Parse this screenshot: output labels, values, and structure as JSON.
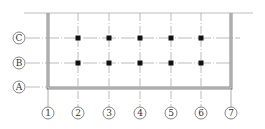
{
  "diagram": {
    "type": "structural-axis-grid",
    "colors": {
      "line": "#b0b0b0",
      "wall": "#8a8a8a",
      "column": "#111111",
      "label": "#444444"
    },
    "rows": [
      {
        "label": "C",
        "y": 38
      },
      {
        "label": "B",
        "y": 63
      },
      {
        "label": "A",
        "y": 87
      }
    ],
    "columns": [
      {
        "label": "1",
        "x": 48
      },
      {
        "label": "2",
        "x": 78
      },
      {
        "label": "3",
        "x": 109
      },
      {
        "label": "4",
        "x": 140
      },
      {
        "label": "5",
        "x": 171
      },
      {
        "label": "6",
        "x": 201
      },
      {
        "label": "7",
        "x": 231
      }
    ],
    "column_markers": [
      {
        "row": "C",
        "col": "2"
      },
      {
        "row": "C",
        "col": "3"
      },
      {
        "row": "C",
        "col": "4"
      },
      {
        "row": "C",
        "col": "5"
      },
      {
        "row": "C",
        "col": "6"
      },
      {
        "row": "B",
        "col": "2"
      },
      {
        "row": "B",
        "col": "3"
      },
      {
        "row": "B",
        "col": "4"
      },
      {
        "row": "B",
        "col": "5"
      },
      {
        "row": "B",
        "col": "6"
      }
    ]
  }
}
